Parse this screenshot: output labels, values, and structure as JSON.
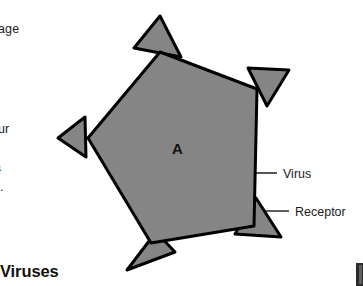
{
  "page": {
    "width": 363,
    "height": 286,
    "background": "#ffffff"
  },
  "margin_text": {
    "line_1": "page",
    "line_2": "our",
    "line_3": "a",
    "line_4": "e."
  },
  "section_heading": "Viruses",
  "figure": {
    "center_letter": "A",
    "virus_body": {
      "name": "virus-capsid",
      "shape": "pentagon",
      "fill": "#858585",
      "stroke": "#000000",
      "stroke_width": 3
    },
    "receptors": {
      "name": "receptor-spikes",
      "count": 5,
      "shape": "triangle",
      "fill": "#858585",
      "stroke": "#000000",
      "stroke_width": 3
    },
    "callouts": [
      {
        "id": "virus",
        "label": "Virus",
        "leader_from_x": 228,
        "leader_from_y": 173,
        "leader_to_x": 277,
        "leader_to_y": 173,
        "text_x": 283,
        "text_y": 178
      },
      {
        "id": "receptor",
        "label": "Receptor",
        "leader_from_x": 265,
        "leader_from_y": 211,
        "leader_to_x": 289,
        "leader_to_y": 211,
        "text_x": 295,
        "text_y": 216
      }
    ]
  }
}
